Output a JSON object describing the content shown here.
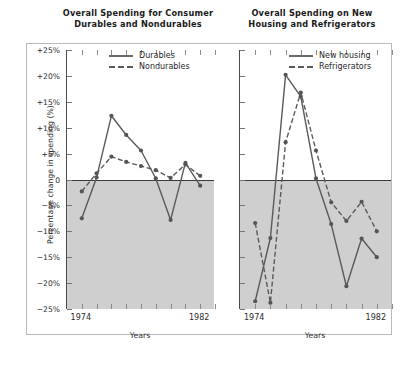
{
  "figure": {
    "background": "#ffffff",
    "frame_color": "#b9b9b9",
    "negative_band_color": "#cfcfcf",
    "line_color": "#5a5a5a",
    "marker_color": "#555555"
  },
  "y_axis": {
    "title": "Percentage change in spending (%)",
    "ticks": [
      25,
      20,
      15,
      10,
      5,
      0,
      -5,
      -10,
      -15,
      -20,
      -25
    ],
    "tick_labels": [
      "+25%",
      "+20%",
      "+15%",
      "+10%",
      "+5%",
      "0",
      "−5%",
      "−10%",
      "−15%",
      "−20%",
      "−25%"
    ],
    "limits": [
      -25,
      25
    ]
  },
  "x_axis": {
    "title": "Years",
    "tick_labels": [
      "1974",
      "1982"
    ],
    "labelled_years": [
      1974,
      1982
    ],
    "limits": [
      1973,
      1983
    ],
    "all_years": [
      1973,
      1974,
      1975,
      1976,
      1977,
      1978,
      1979,
      1980,
      1981,
      1982,
      1983
    ]
  },
  "chart_data": [
    {
      "id": "consumer-durables",
      "type": "line",
      "title": "Overall Spending for Consumer\nDurables and Nondurables",
      "title_line1": "Overall Spending for Consumer",
      "title_line2": "Durables and Nondurables",
      "xlabel": "Years",
      "ylabel": "Percentage change in spending (%)",
      "xlim": [
        1973,
        1983
      ],
      "ylim": [
        -25,
        25
      ],
      "grid": false,
      "legend_position": "top-center",
      "x": [
        1974,
        1975,
        1976,
        1977,
        1978,
        1979,
        1980,
        1981,
        1982
      ],
      "series": [
        {
          "name": "Durables",
          "style": "solid",
          "values": [
            -7.5,
            0.4,
            12.3,
            8.6,
            5.6,
            0.2,
            -7.8,
            3.2,
            -1.2
          ]
        },
        {
          "name": "Nondurables",
          "style": "dashed",
          "values": [
            -2.3,
            1.2,
            4.4,
            3.4,
            2.6,
            1.8,
            0.3,
            2.9,
            0.7
          ]
        }
      ]
    },
    {
      "id": "new-housing-refrigerators",
      "type": "line",
      "title": "Overall Spending on New\nHousing and Refrigerators",
      "title_line1": "Overall Spending on New",
      "title_line2": "Housing and Refrigerators",
      "xlabel": "Years",
      "ylabel": "Percentage change in spending (%)",
      "xlim": [
        1973,
        1983
      ],
      "ylim": [
        -25,
        25
      ],
      "grid": false,
      "legend_position": "top-center",
      "x": [
        1974,
        1975,
        1976,
        1977,
        1978,
        1979,
        1980,
        1981,
        1982
      ],
      "series": [
        {
          "name": "New housing",
          "style": "solid",
          "values": [
            -23.5,
            -11.3,
            20.2,
            16.0,
            0.2,
            -8.6,
            -20.6,
            -11.4,
            -15.0
          ]
        },
        {
          "name": "Refrigerators",
          "style": "dashed",
          "values": [
            -8.4,
            -23.8,
            7.2,
            16.8,
            5.6,
            -4.4,
            -8.0,
            -4.3,
            -10.0
          ]
        }
      ]
    }
  ]
}
